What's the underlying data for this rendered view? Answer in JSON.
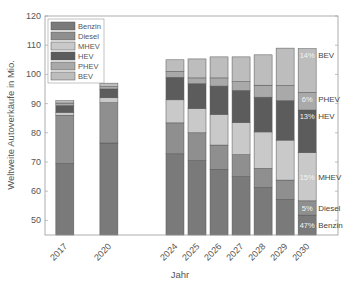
{
  "chart_data": {
    "type": "bar",
    "stacked": true,
    "title": "",
    "xlabel": "Jahr",
    "ylabel": "Weltweite Autoverkäufe in Mio.",
    "ylim": [
      45,
      120
    ],
    "yticks": [
      50,
      60,
      70,
      80,
      90,
      100,
      110,
      120
    ],
    "grid": false,
    "legend_position": "upper left",
    "categories": [
      "2017",
      "2020",
      "2024",
      "2025",
      "2026",
      "2027",
      "2028",
      "2029",
      "2030"
    ],
    "category_positions": [
      0,
      2,
      5,
      6,
      7,
      8,
      9,
      10,
      11
    ],
    "series": [
      {
        "name": "Benzin",
        "color": "#7a7a7a",
        "cumulative_top": [
          69.5,
          76.5,
          72.8,
          70.5,
          67.5,
          65.0,
          61.3,
          57.2,
          51.8
        ]
      },
      {
        "name": "Diesel",
        "color": "#8f8f8f",
        "cumulative_top": [
          86.0,
          90.3,
          83.4,
          80.0,
          75.8,
          72.5,
          67.8,
          63.8,
          56.7
        ]
      },
      {
        "name": "MHEV",
        "color": "#c9c9c9",
        "cumulative_top": [
          87.0,
          92.0,
          91.3,
          88.3,
          86.3,
          83.5,
          80.3,
          77.5,
          73.2
        ]
      },
      {
        "name": "HEV",
        "color": "#5c5c5c",
        "cumulative_top": [
          89.3,
          95.0,
          99.0,
          96.8,
          96.0,
          94.5,
          92.2,
          91.0,
          87.8
        ]
      },
      {
        "name": "PHEV",
        "color": "#a9a9a9",
        "cumulative_top": [
          90.2,
          95.8,
          101.0,
          98.8,
          98.8,
          97.5,
          96.3,
          96.2,
          93.8
        ]
      },
      {
        "name": "BEV",
        "color": "#bdbdbd",
        "cumulative_top": [
          91.0,
          97.0,
          105.0,
          105.3,
          106.0,
          106.0,
          106.7,
          109.0,
          108.8
        ]
      }
    ],
    "annotations_2030": [
      {
        "series": "BEV",
        "percent": "14%",
        "label": "BEV"
      },
      {
        "series": "PHEV",
        "percent": "6%",
        "label": "PHEV"
      },
      {
        "series": "HEV",
        "percent": "13%",
        "label": "HEV"
      },
      {
        "series": "MHEV",
        "percent": "15%",
        "label": "MHEV"
      },
      {
        "series": "Diesel",
        "percent": "5%",
        "label": "Diesel"
      },
      {
        "series": "Benzin",
        "percent": "47%",
        "label": "Benzin"
      }
    ]
  },
  "legend": {
    "items": [
      "Benzin",
      "Diesel",
      "MHEV",
      "HEV",
      "PHEV",
      "BEV"
    ]
  }
}
